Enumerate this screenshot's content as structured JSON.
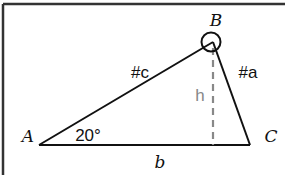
{
  "diagram": {
    "vertices": {
      "A": "A",
      "B": "B",
      "C": "C"
    },
    "sides": {
      "c": "#c",
      "a": "#a",
      "b": "b"
    },
    "height_label": "h",
    "angle_A_label": "20°",
    "colors": {
      "line": "#111111",
      "height_line": "#888888",
      "border": "#333333"
    }
  }
}
